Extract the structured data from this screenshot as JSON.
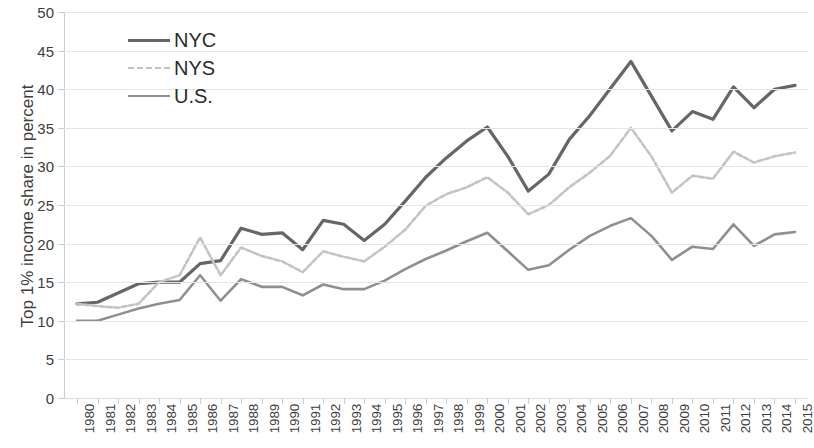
{
  "chart_data": {
    "type": "line",
    "title": "",
    "xlabel": "",
    "ylabel": "Top 1% income share in percent",
    "ylim": [
      0,
      50
    ],
    "ytick_step": 5,
    "grid": true,
    "legend_position": "top-left",
    "x": [
      "1980",
      "1981",
      "1982",
      "1983",
      "1984",
      "1985",
      "1986",
      "1987",
      "1988",
      "1989",
      "1990",
      "1991",
      "1992",
      "1993",
      "1994",
      "1995",
      "1996",
      "1997",
      "1998",
      "1999",
      "2000",
      "2001",
      "2002",
      "2003",
      "2004",
      "2005",
      "2006",
      "2007",
      "2008",
      "2009",
      "2010",
      "2011",
      "2012",
      "2013",
      "2014",
      "2015"
    ],
    "yticks": [
      "0",
      "5",
      "10",
      "15",
      "20",
      "25",
      "30",
      "35",
      "40",
      "45",
      "50"
    ],
    "series": [
      {
        "name": "NYC",
        "color": "#666666",
        "style": "solid",
        "width": 3.2,
        "values": [
          12.2,
          12.4,
          13.6,
          14.8,
          15.0,
          15.0,
          17.4,
          17.8,
          22.0,
          21.2,
          21.4,
          19.2,
          23.0,
          22.5,
          20.4,
          22.5,
          25.5,
          28.6,
          31.1,
          33.3,
          35.1,
          31.3,
          26.8,
          29.0,
          33.5,
          36.6,
          40.1,
          43.6,
          39.1,
          34.6,
          37.1,
          36.1,
          40.3,
          37.6,
          40.0,
          40.5
        ]
      },
      {
        "name": "NYS",
        "color": "#c3c3c3",
        "style": "dashed",
        "width": 2.6,
        "values": [
          12.2,
          11.9,
          11.7,
          12.2,
          15.0,
          15.9,
          20.8,
          15.9,
          19.5,
          18.4,
          17.7,
          16.3,
          19.0,
          18.3,
          17.7,
          19.6,
          21.8,
          24.9,
          26.4,
          27.3,
          28.6,
          26.6,
          23.8,
          25.0,
          27.3,
          29.2,
          31.4,
          35.0,
          31.3,
          26.6,
          28.8,
          28.4,
          31.9,
          30.5,
          31.3,
          31.8
        ]
      },
      {
        "name": "U.S.",
        "color": "#8f8f8f",
        "style": "solid",
        "width": 2.6,
        "values": [
          10.0,
          10.0,
          10.8,
          11.6,
          12.2,
          12.7,
          15.9,
          12.6,
          15.4,
          14.4,
          14.4,
          13.3,
          14.7,
          14.1,
          14.1,
          15.2,
          16.7,
          18.0,
          19.1,
          20.3,
          21.4,
          19.0,
          16.6,
          17.2,
          19.2,
          21.0,
          22.3,
          23.3,
          21.0,
          17.9,
          19.6,
          19.3,
          22.5,
          19.7,
          21.2,
          21.5
        ]
      }
    ]
  },
  "legend": {
    "items": [
      {
        "label": "NYC"
      },
      {
        "label": "NYS"
      },
      {
        "label": "U.S."
      }
    ]
  }
}
